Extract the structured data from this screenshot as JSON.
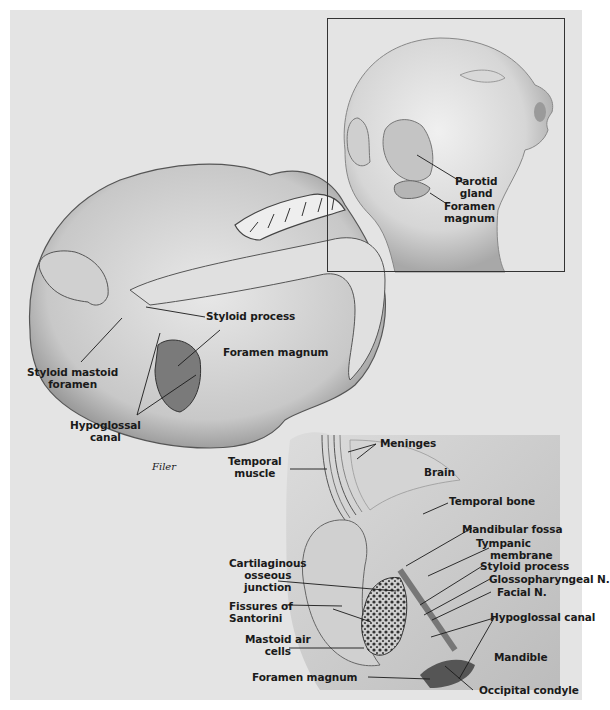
{
  "figure": {
    "signature": "Filer",
    "background_color": "#e4e4e4",
    "ink_color": "#1a1a1a"
  },
  "inset": {
    "labels": {
      "parotid": [
        "Parotid",
        "gland"
      ],
      "foramen": [
        "Foramen",
        "magnum"
      ]
    }
  },
  "skull": {
    "labels": {
      "styloid_process": "Styloid process",
      "foramen_magnum": "Foramen magnum",
      "styloid_mastoid": [
        "Styloid mastoid",
        "foramen"
      ],
      "hypoglossal": [
        "Hypoglossal",
        "canal"
      ]
    }
  },
  "section": {
    "labels": {
      "meninges": "Meninges",
      "temporal_muscle": [
        "Temporal",
        "muscle"
      ],
      "brain": "Brain",
      "temporal_bone": "Temporal bone",
      "mandibular_fossa": "Mandibular fossa",
      "tympanic": [
        "Tympanic",
        "membrane"
      ],
      "styloid_process": "Styloid process",
      "glossopharyngeal": "Glossopharyngeal N.",
      "facial": "Facial N.",
      "cartilaginous": [
        "Cartilaginous",
        "osseous",
        "junction"
      ],
      "fissures": [
        "Fissures of",
        "Santorini"
      ],
      "hypoglossal_canal": "Hypoglossal canal",
      "mastoid": [
        "Mastoid air",
        "cells"
      ],
      "mandible": "Mandible",
      "foramen_magnum": "Foramen magnum",
      "occipital_condyle": "Occipital condyle"
    }
  }
}
